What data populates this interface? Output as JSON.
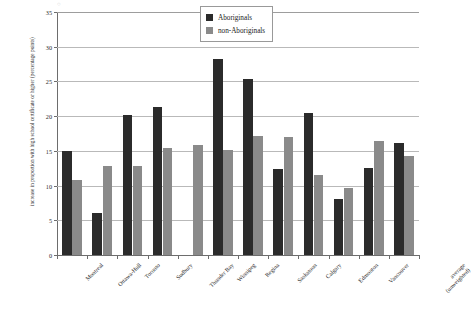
{
  "chart_data": {
    "type": "bar",
    "title": "",
    "subtitle": "",
    "xlabel": "",
    "ylabel": "increase in proportion with high school certificate or higher (percentage points)",
    "ylim": [
      0,
      35
    ],
    "ytick_labels": [
      "0",
      "5",
      "10",
      "15",
      "20",
      "25",
      "30",
      "35"
    ],
    "ytick_values": [
      0,
      5,
      10,
      15,
      20,
      25,
      30,
      35
    ],
    "grid": true,
    "legend_position": "top-right",
    "categories": [
      "Montreal",
      "Ottawa-Hull",
      "Toronto",
      "Sudbury",
      "Thunder Bay",
      "Winnipeg",
      "Regina",
      "Saskatoon",
      "Calgary",
      "Edmonton",
      "Vancouver",
      "average (unweighted)"
    ],
    "series": [
      {
        "name": "Aboriginals",
        "color": "#2b2b2b",
        "values": [
          15.0,
          6.1,
          20.2,
          21.3,
          null,
          28.3,
          25.4,
          12.4,
          20.5,
          8.1,
          12.5,
          16.2
        ]
      },
      {
        "name": "non-Aboriginals",
        "color": "#8a8a8a",
        "values": [
          10.8,
          12.8,
          12.8,
          15.4,
          15.8,
          15.1,
          17.1,
          17.0,
          11.5,
          9.6,
          16.4,
          14.2
        ]
      }
    ]
  },
  "legend": {
    "items": [
      {
        "label": "Aboriginals"
      },
      {
        "label": "non-Aboriginals"
      }
    ]
  },
  "corner_mark": "○"
}
